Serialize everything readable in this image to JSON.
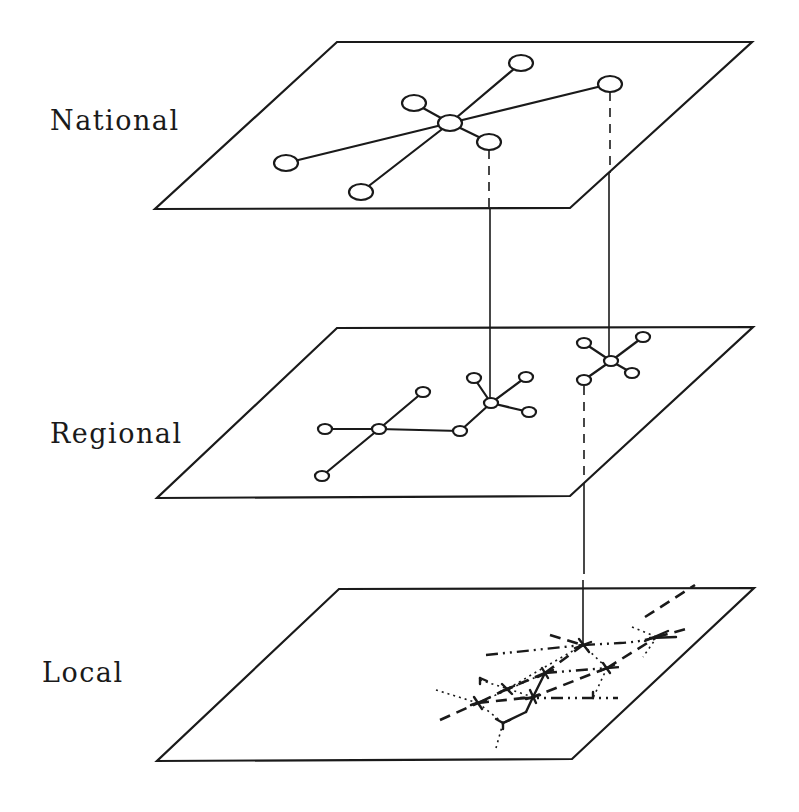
{
  "labels": {
    "national": "National",
    "regional": "Regional",
    "local": "Local"
  },
  "colors": {
    "ink": "#1a1a1a",
    "background": "#ffffff"
  },
  "levels": [
    {
      "name": "National",
      "plane": [
        [
          337,
          42
        ],
        [
          752,
          42
        ],
        [
          570,
          208
        ],
        [
          155,
          209
        ]
      ],
      "hub": [
        450,
        123
      ],
      "nodes": [
        [
          521,
          63
        ],
        [
          610,
          84
        ],
        [
          414,
          103
        ],
        [
          489,
          142
        ],
        [
          286,
          163
        ],
        [
          361,
          192
        ]
      ]
    },
    {
      "name": "Regional",
      "plane": [
        [
          337,
          328
        ],
        [
          753,
          327
        ],
        [
          570,
          496
        ],
        [
          157,
          498
        ]
      ],
      "networks": [
        {
          "hub": [
            379,
            429
          ],
          "nodes": [
            [
              325,
              429
            ],
            [
              423,
              392
            ],
            [
              322,
              476
            ],
            [
              460,
              431
            ]
          ]
        },
        {
          "hub": [
            491,
            403
          ],
          "nodes": [
            [
              474,
              378
            ],
            [
              526,
              377
            ],
            [
              529,
              412
            ],
            [
              460,
              431
            ]
          ]
        },
        {
          "hub": [
            611,
            361
          ],
          "nodes": [
            [
              584,
              343
            ],
            [
              643,
              337
            ],
            [
              632,
              373
            ],
            [
              584,
              380
            ]
          ]
        }
      ]
    },
    {
      "name": "Local",
      "plane": [
        [
          339,
          589
        ],
        [
          754,
          588
        ],
        [
          572,
          759
        ],
        [
          157,
          761
        ]
      ],
      "hubs": [
        [
          583,
          645
        ],
        [
          657,
          637
        ],
        [
          545,
          673
        ],
        [
          607,
          668
        ],
        [
          507,
          689
        ],
        [
          533,
          697
        ],
        [
          478,
          703
        ],
        [
          503,
          723
        ],
        [
          593,
          698
        ]
      ]
    }
  ],
  "connectors": [
    {
      "from": "National node (489,142)",
      "to": "Regional hub (491,403)",
      "style": "dashed-then-solid"
    },
    {
      "from": "National node (610,84)",
      "to": "Regional hub (611,361)",
      "style": "dashed-then-solid"
    },
    {
      "from": "Regional node (584,380)",
      "to": "Local hub (583,645)",
      "style": "dashed-then-solid"
    }
  ]
}
